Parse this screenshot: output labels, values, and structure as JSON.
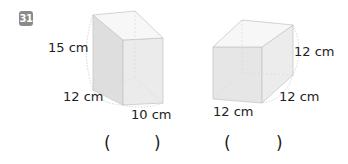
{
  "problem": {
    "number": "31"
  },
  "figures": [
    {
      "shape": "cuboid",
      "labels": {
        "height": "15 cm",
        "depth": "12 cm",
        "width": "10 cm"
      },
      "answer_open": "(",
      "answer_close": ")"
    },
    {
      "shape": "cube",
      "labels": {
        "height": "12 cm",
        "depth": "12 cm",
        "width": "12 cm"
      },
      "answer_open": "(",
      "answer_close": ")"
    }
  ],
  "colors": {
    "badge": "#8a8a8a",
    "face_front": "#e4e4e4",
    "face_side": "#ececec",
    "face_top": "#f6f6f6",
    "edge": "#c8c8c8"
  }
}
